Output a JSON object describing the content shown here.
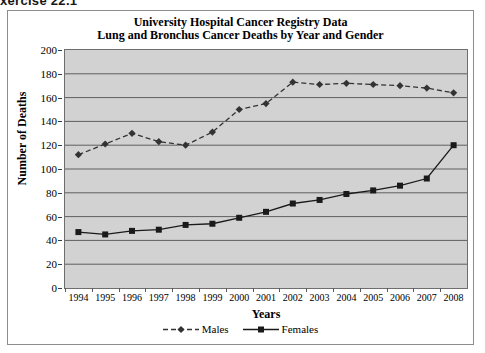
{
  "caption": "xercise 22.1",
  "figure": {
    "title_line1": "University Hospital Cancer Registry Data",
    "title_line2": "Lung and Bronchus Cancer Deaths by Year and Gender"
  },
  "chart_data": {
    "type": "line",
    "title": "University Hospital Cancer Registry Data\nLung and Bronchus Cancer Deaths by Year and Gender",
    "xlabel": "Years",
    "ylabel": "Number of Deaths",
    "categories": [
      "1994",
      "1995",
      "1996",
      "1997",
      "1998",
      "1999",
      "2000",
      "2001",
      "2002",
      "2003",
      "2004",
      "2005",
      "2006",
      "2007",
      "2008"
    ],
    "series": [
      {
        "name": "Males",
        "marker": "diamond",
        "line_style": "dashed",
        "color": "#333333",
        "values": [
          112,
          121,
          130,
          123,
          120,
          131,
          150,
          155,
          173,
          171,
          172,
          171,
          170,
          168,
          164
        ]
      },
      {
        "name": "Females",
        "marker": "square",
        "line_style": "solid",
        "color": "#1a1a1a",
        "values": [
          47,
          45,
          48,
          49,
          53,
          54,
          59,
          64,
          71,
          74,
          79,
          82,
          86,
          92,
          120
        ]
      }
    ],
    "ylim": [
      0,
      200
    ],
    "ytick_values": [
      0,
      20,
      40,
      60,
      80,
      100,
      120,
      140,
      160,
      180,
      200
    ],
    "ytick_labels": [
      "0",
      "20",
      "40",
      "60",
      "80",
      "100",
      "120",
      "140",
      "160",
      "180",
      "200"
    ],
    "grid": true,
    "grid_axis": "y",
    "legend_position": "bottom",
    "plot_background": "#d2d2d2"
  }
}
